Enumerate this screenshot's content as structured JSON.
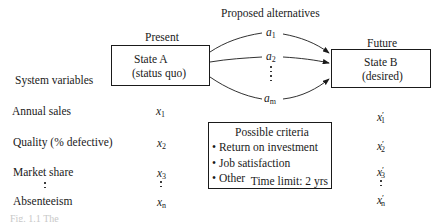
{
  "header": {
    "alternatives_title": "Proposed alternatives",
    "present_label": "Present",
    "future_label": "Future"
  },
  "state_a": {
    "line1": "State A",
    "line2": "(status quo)"
  },
  "state_b": {
    "line1": "State B",
    "line2": "(desired)"
  },
  "alternatives": [
    {
      "base": "a",
      "sub": "1"
    },
    {
      "base": "a",
      "sub": "2"
    },
    {
      "base": "a",
      "sub": "m"
    }
  ],
  "system_variables": {
    "title": "System variables",
    "rows": [
      {
        "label": "Annual sales",
        "present": "x",
        "present_sub": "1",
        "future": "x",
        "future_sup": "′",
        "future_sub": "1"
      },
      {
        "label": "Quality (% defective)",
        "present": "x",
        "present_sub": "2",
        "future": "x",
        "future_sup": "′",
        "future_sub": "2"
      },
      {
        "label": "Market share",
        "present": "x",
        "present_sub": "3",
        "future": "x",
        "future_sup": "′",
        "future_sub": "3"
      },
      {
        "label": "Absenteeism",
        "present": "x",
        "present_sub": "n",
        "future": "x",
        "future_sup": "′",
        "future_sub": "n"
      }
    ]
  },
  "criteria": {
    "title": "Possible criteria",
    "items": [
      "Return on investment",
      "Job satisfaction",
      "Other"
    ],
    "bullet": "•",
    "time_limit": "Time limit: 2 yrs"
  },
  "caption": "Fig. 1.1  The"
}
